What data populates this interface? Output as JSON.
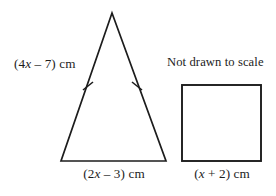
{
  "figure": {
    "note": "Not drawn to scale",
    "stroke_color": "#1c1c1c",
    "background_color": "#ffffff",
    "triangle": {
      "name": "isosceles-triangle",
      "leg_label_prefix": "(4",
      "leg_label_var": "x",
      "leg_label_suffix": " – 7) cm",
      "leg_label_full": "(4x – 7) cm",
      "base_label_prefix": "(2",
      "base_label_var": "x",
      "base_label_suffix": " – 3) cm",
      "base_label_full": "(2x – 3) cm",
      "tick_marks": 2,
      "apex": [
        112,
        13
      ],
      "base_left": [
        61,
        161
      ],
      "base_right": [
        166,
        161
      ]
    },
    "square": {
      "name": "square",
      "side_label_prefix": "(",
      "side_label_var": "x",
      "side_label_suffix": " + 2) cm",
      "side_label_full": "(x + 2) cm",
      "top_left": [
        182,
        85
      ],
      "bottom_right": [
        261,
        161
      ]
    }
  }
}
